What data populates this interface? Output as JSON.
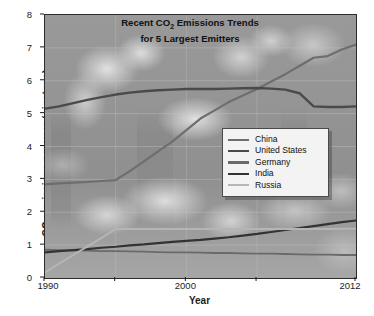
{
  "chart_data": {
    "type": "line",
    "title": "Recent CO2 Emissions Trends for 5 Largest Emitters",
    "title_line1": "Recent CO",
    "title_line1_sub": "2",
    "title_line1_rest": " Emissions Trends",
    "title_line2": "for 5 Largest Emitters",
    "xlabel": "Year",
    "ylabel_pre": "CO",
    "ylabel_sub": "2",
    "ylabel_post": " emissions per year (gigatons)",
    "ylabel": "CO2 emissions per year (gigatons)",
    "xlim": [
      1990,
      2012
    ],
    "ylim": [
      0,
      8
    ],
    "grid": true,
    "legend_position": "center-right",
    "xticks": [
      1990,
      1995,
      2000,
      2005,
      2012
    ],
    "xtick_labels": [
      "1990",
      "",
      "2000",
      "",
      "2012"
    ],
    "yticks": [
      0,
      1,
      2,
      3,
      4,
      5,
      6,
      7,
      8
    ],
    "ytick_labels": [
      "0",
      "1",
      "2",
      "3",
      "4",
      "5",
      "6",
      "7",
      "8"
    ],
    "x": [
      1990,
      1991,
      1992,
      1993,
      1994,
      1995,
      1996,
      1997,
      1998,
      1999,
      2000,
      2001,
      2002,
      2003,
      2004,
      2005,
      2006,
      2007,
      2008,
      2009,
      2010,
      2011,
      2012
    ],
    "series": [
      {
        "name": "China",
        "color": "#6e6e6e",
        "width": 2.2,
        "values": [
          2.85,
          2.88,
          2.9,
          2.92,
          2.95,
          2.98,
          3.25,
          3.55,
          3.85,
          4.15,
          4.5,
          4.85,
          5.1,
          5.35,
          5.55,
          5.75,
          5.98,
          6.2,
          6.45,
          6.7,
          6.75,
          6.95,
          7.1
        ]
      },
      {
        "name": "United States",
        "color": "#4a4a4a",
        "width": 2.4,
        "values": [
          5.15,
          5.22,
          5.32,
          5.42,
          5.5,
          5.58,
          5.64,
          5.68,
          5.71,
          5.73,
          5.75,
          5.75,
          5.75,
          5.76,
          5.77,
          5.78,
          5.76,
          5.73,
          5.62,
          5.22,
          5.2,
          5.2,
          5.22
        ]
      },
      {
        "name": "Germany",
        "color": "#6a6a6a",
        "width": 1.8,
        "values": [
          0.86,
          0.85,
          0.84,
          0.83,
          0.82,
          0.82,
          0.81,
          0.8,
          0.79,
          0.78,
          0.78,
          0.77,
          0.76,
          0.76,
          0.75,
          0.74,
          0.74,
          0.73,
          0.72,
          0.71,
          0.71,
          0.7,
          0.7
        ]
      },
      {
        "name": "India",
        "color": "#333333",
        "width": 2.2,
        "values": [
          0.78,
          0.82,
          0.85,
          0.88,
          0.92,
          0.95,
          0.99,
          1.02,
          1.06,
          1.1,
          1.13,
          1.16,
          1.2,
          1.24,
          1.29,
          1.34,
          1.4,
          1.46,
          1.52,
          1.58,
          1.64,
          1.7,
          1.75
        ]
      },
      {
        "name": "Russia",
        "color": "#b5b5b5",
        "width": 2.0,
        "values": [
          0.17,
          0.44,
          0.7,
          0.96,
          1.22,
          1.49,
          1.49,
          1.49,
          1.49,
          1.49,
          1.49,
          1.49,
          1.49,
          1.49,
          1.49,
          1.49,
          1.49,
          1.49,
          1.49,
          1.49,
          1.49,
          1.5,
          1.5
        ]
      }
    ]
  }
}
